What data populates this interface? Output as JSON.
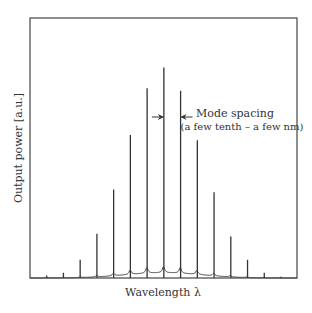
{
  "chart_data": {
    "type": "line",
    "title": "",
    "xlabel": "Wavelength λ",
    "ylabel": "Output power [a.u.]",
    "xlim": [
      0,
      16
    ],
    "ylim": [
      0,
      1
    ],
    "grid": false,
    "x_ticks": [],
    "y_ticks": [],
    "series": [
      {
        "name": "longitudinal modes",
        "mode_index": [
          1,
          2,
          3,
          4,
          5,
          6,
          7,
          8,
          9,
          10,
          11,
          12,
          13,
          14,
          15
        ],
        "values": [
          0.01,
          0.02,
          0.07,
          0.17,
          0.34,
          0.55,
          0.73,
          0.81,
          0.72,
          0.53,
          0.33,
          0.16,
          0.07,
          0.02,
          0.005
        ]
      }
    ],
    "pedestal_peak": 0.02,
    "annotations": [
      {
        "text_line1": "Mode spacing",
        "text_line2": "(a few tenth – a few nm)",
        "between_modes": [
          8,
          9
        ]
      }
    ]
  }
}
